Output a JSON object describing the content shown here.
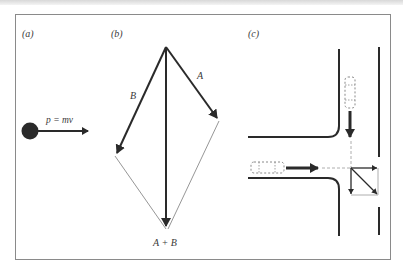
{
  "figure": {
    "panels": [
      {
        "id": "a",
        "label": "(a)",
        "equation": "p = mv"
      },
      {
        "id": "b",
        "label": "(b)",
        "vector_a": "A",
        "vector_b": "B",
        "resultant": "A + B"
      },
      {
        "id": "c",
        "label": "(c)"
      }
    ],
    "colors": {
      "ink": "#2a2a2a",
      "thin_line": "#8a8a8a",
      "frame": "#8a8a8a",
      "background": "#ffffff"
    }
  }
}
